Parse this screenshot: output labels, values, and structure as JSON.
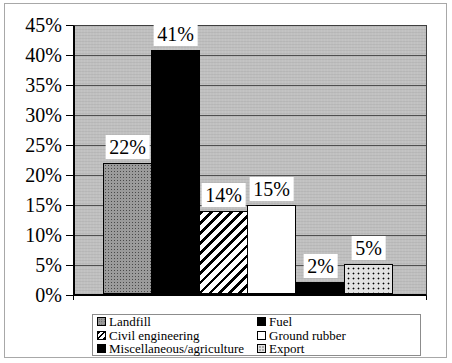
{
  "chart_data": {
    "type": "bar",
    "title": "",
    "xlabel": "",
    "ylabel": "",
    "unit": "%",
    "grid": true,
    "y_axis": {
      "min": 0,
      "max": 45,
      "step": 5,
      "tick_labels": [
        "45%",
        "40%",
        "35%",
        "30%",
        "25%",
        "20%",
        "15%",
        "10%",
        "5%",
        "0%"
      ]
    },
    "categories": [
      "Landfill",
      "Fuel",
      "Civil engineering",
      "Ground rubber",
      "Miscellaneous/agriculture",
      "Export"
    ],
    "values": [
      22,
      41,
      14,
      15,
      2,
      5
    ],
    "series": [
      {
        "label": "Landfill",
        "value": 22,
        "value_label": "22%",
        "pattern": "gray-dots"
      },
      {
        "label": "Fuel",
        "value": 41,
        "value_label": "41%",
        "pattern": "solid-black"
      },
      {
        "label": "Civil engineering",
        "value": 14,
        "value_label": "14%",
        "pattern": "diagonal-hatch"
      },
      {
        "label": "Ground rubber",
        "value": 15,
        "value_label": "15%",
        "pattern": "solid-white"
      },
      {
        "label": "Miscellaneous/agriculture",
        "value": 2,
        "value_label": "2%",
        "pattern": "solid-black"
      },
      {
        "label": "Export",
        "value": 5,
        "value_label": "5%",
        "pattern": "dots"
      }
    ],
    "legend": {
      "position": "bottom",
      "columns": 2,
      "entries": [
        "Landfill",
        "Fuel",
        "Civil engineering",
        "Ground rubber",
        "Miscellaneous/agriculture",
        "Export"
      ]
    },
    "colors": {
      "plot_background": "#c0c0c0",
      "gridline": "#4f4f4f",
      "bar_gray": "#9b9b9b",
      "bar_black": "#000000",
      "bar_white": "#ffffff",
      "dotted_fill": "#e2e2e2",
      "outer_border": "#a8a8a8",
      "label_box_background": "#ffffff"
    }
  }
}
